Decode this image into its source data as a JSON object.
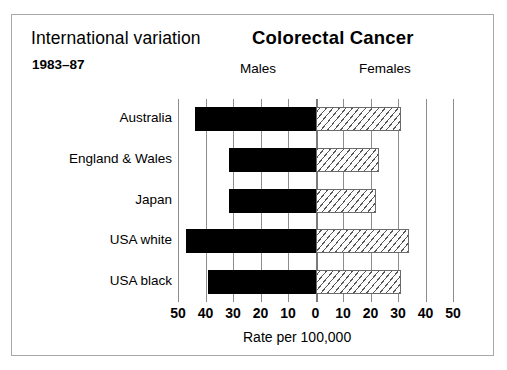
{
  "header": {
    "title_left": "International variation",
    "title_main": "Colorectal Cancer",
    "years": "1983–87",
    "panel_males": "Males",
    "panel_females": "Females"
  },
  "axis": {
    "title": "Rate per 100,000",
    "tick_labels": [
      "50",
      "40",
      "30",
      "20",
      "10",
      "0",
      "10",
      "20",
      "30",
      "40",
      "50"
    ],
    "tick_values": [
      -50,
      -40,
      -30,
      -20,
      -10,
      0,
      10,
      20,
      30,
      40,
      50
    ]
  },
  "colors": {
    "male_fill": "#000000",
    "female_fill": "#ffffff",
    "female_hatch": "#575757",
    "gridline": "#8d8d8d",
    "border": "#a8a8a8",
    "text": "#000000"
  },
  "chart_data": {
    "type": "bar",
    "orientation": "horizontal",
    "layout": "diverging-pyramid",
    "title": "Colorectal Cancer",
    "subtitle": "International variation 1983–87",
    "xlabel": "Rate per 100,000",
    "ylabel": "",
    "xlim": [
      -50,
      50
    ],
    "xticks": [
      -50,
      -40,
      -30,
      -20,
      -10,
      0,
      10,
      20,
      30,
      40,
      50
    ],
    "xticklabels": [
      "50",
      "40",
      "30",
      "20",
      "10",
      "0",
      "10",
      "20",
      "30",
      "40",
      "50"
    ],
    "grid": true,
    "legend": [
      "Males",
      "Females"
    ],
    "legend_position": "top",
    "categories": [
      "Australia",
      "England & Wales",
      "Japan",
      "USA white",
      "USA black"
    ],
    "series": [
      {
        "name": "Males",
        "side": "left",
        "values": [
          44,
          31.5,
          31.5,
          47,
          39
        ]
      },
      {
        "name": "Females",
        "side": "right",
        "values": [
          31,
          23,
          22,
          34,
          31
        ]
      }
    ]
  }
}
